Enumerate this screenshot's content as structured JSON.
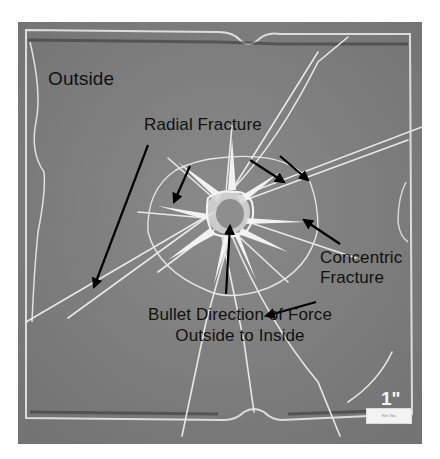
{
  "figure": {
    "labels": {
      "outside": "Outside",
      "radial_fracture": "Radial Fracture",
      "concentric_line1": "Concentric",
      "concentric_line2": "Fracture",
      "bullet_line1": "Bullet Direction of Force",
      "bullet_line2": "Outside to Inside"
    },
    "scale_bar": {
      "label": "1\"",
      "ruler_text": "Ref. No."
    },
    "caption_partial": "",
    "colors": {
      "background": "#ffffff",
      "glass": "#7f7f7f",
      "fracture": "#e6e6e6",
      "label_text": "#111111",
      "arrow": "#000000"
    }
  }
}
